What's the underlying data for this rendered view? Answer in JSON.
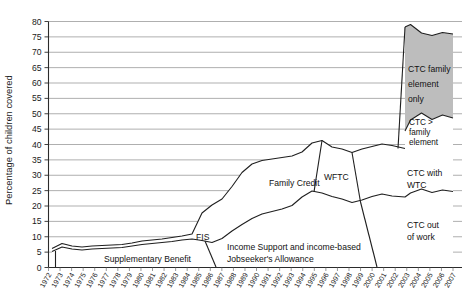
{
  "chart_data": {
    "type": "area",
    "title": "",
    "xlabel": "",
    "ylabel": "Percentage of children covered",
    "ylim": [
      0,
      80
    ],
    "ytick_step": 5,
    "yticks": [
      "0",
      "5",
      "10",
      "15",
      "20",
      "25",
      "30",
      "35",
      "40",
      "45",
      "50",
      "55",
      "60",
      "65",
      "70",
      "75",
      "80"
    ],
    "grid": true,
    "legend_position": "inline-annotations",
    "xlim": [
      1972,
      2007
    ],
    "categories": [
      "1972",
      "1973",
      "1974",
      "1975",
      "1976",
      "1977",
      "1978",
      "1979",
      "1980",
      "1981",
      "1982",
      "1983",
      "1984",
      "1985",
      "1986",
      "1987",
      "1988",
      "1989",
      "1990",
      "1991",
      "1992",
      "1993",
      "1994",
      "1995",
      "1996",
      "1997",
      "1998",
      "1999",
      "2000",
      "2001",
      "2002",
      "2003",
      "2004",
      "2005",
      "2006",
      "2007"
    ],
    "series": [
      {
        "name": "Supplementary Benefit / Income Support and income-based Jobseeker's Allowance / CTC out of work",
        "values": [
          6.2,
          6.0,
          5.3,
          5.0,
          5.4,
          6.2,
          6.6,
          6.8,
          7.0,
          8.0,
          9.0,
          9.4,
          9.2,
          9.1,
          9.6,
          10.1,
          10.4,
          10.2,
          10.6,
          12.5,
          14.8,
          16.4,
          17.0,
          17.2,
          17.1,
          16.7,
          16.3,
          16.0,
          15.8,
          15.6,
          15.5,
          15.4,
          15.2,
          15.0,
          14.8,
          14.6
        ]
      },
      {
        "name": "FIS / Family Credit / WFTC / CTC with WTC",
        "values": [
          0.0,
          1.2,
          1.3,
          1.2,
          1.1,
          1.1,
          1.2,
          1.2,
          1.2,
          1.3,
          1.4,
          1.4,
          1.4,
          1.5,
          1.6,
          1.7,
          5.8,
          7.2,
          8.0,
          9.5,
          11.5,
          13.2,
          14.5,
          15.0,
          15.3,
          15.6,
          15.8,
          16.4,
          17.4,
          18.0,
          17.6,
          17.4,
          17.3,
          17.2,
          17.1,
          17.0
        ]
      },
      {
        "name": "CTC > family element",
        "values": [
          0,
          0,
          0,
          0,
          0,
          0,
          0,
          0,
          0,
          0,
          0,
          0,
          0,
          0,
          0,
          0,
          0,
          0,
          0,
          0,
          0,
          0,
          0,
          0,
          0,
          0,
          0,
          0,
          0,
          0,
          0,
          6.5,
          7.4,
          7.0,
          7.6,
          7.3
        ]
      },
      {
        "name": "CTC family element only",
        "values": [
          0,
          0,
          0,
          0,
          0,
          0,
          0,
          0,
          0,
          0,
          0,
          0,
          0,
          0,
          0,
          0,
          0,
          0,
          0,
          0,
          0,
          0,
          0,
          0,
          0,
          0,
          0,
          0,
          0,
          0,
          0,
          38.0,
          35.0,
          34.5,
          34.0,
          33.5
        ]
      }
    ],
    "annotations": [
      {
        "id": "supplementary-benefit",
        "text": "Supplementary Benefit"
      },
      {
        "id": "fis",
        "text": "FIS"
      },
      {
        "id": "income-support",
        "text": "Income Support and income-based"
      },
      {
        "id": "income-support-2",
        "text": "Jobseeker's Allowance"
      },
      {
        "id": "family-credit",
        "text": "Family Credit"
      },
      {
        "id": "wftc",
        "text": "WFTC"
      },
      {
        "id": "ctc-with-wtc",
        "text": "CTC with"
      },
      {
        "id": "ctc-with-wtc-2",
        "text": "WTC"
      },
      {
        "id": "ctc-out-of-work",
        "text": "CTC out"
      },
      {
        "id": "ctc-out-of-work-2",
        "text": "of work"
      },
      {
        "id": "ctc-gt-family-element",
        "text": "CTC >"
      },
      {
        "id": "ctc-gt-family-element-2",
        "text": "family"
      },
      {
        "id": "ctc-gt-family-element-3",
        "text": "element"
      },
      {
        "id": "ctc-family-element-only",
        "text": "CTC family"
      },
      {
        "id": "ctc-family-element-only-2",
        "text": "element"
      },
      {
        "id": "ctc-family-element-only-3",
        "text": "only"
      }
    ],
    "colors": {
      "gridline": "#8c8c8c",
      "axis": "#2b2b2b",
      "band_outline": "#1f1f1f",
      "shaded_band_fill": "#bdbdbd",
      "plain_band_fill": "#ffffff"
    }
  }
}
